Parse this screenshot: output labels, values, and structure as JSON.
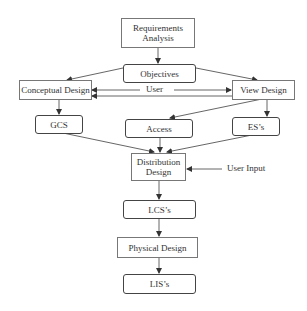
{
  "diagram": {
    "nodes": {
      "requirements_analysis": "Requirements\nAnalysis",
      "objectives": "Objectives",
      "conceptual_design": "Conceptual Design",
      "view_design": "View Design",
      "gcs": "GCS",
      "access": "Access",
      "ess": "ES’s",
      "distribution_design": "Distribution\nDesign",
      "lcss": "LCS’s",
      "physical_design": "Physical Design",
      "liss": "LIS’s"
    },
    "labels": {
      "user": "User",
      "user_input": "User Input"
    },
    "edges": [
      [
        "requirements_analysis",
        "objectives"
      ],
      [
        "objectives",
        "conceptual_design"
      ],
      [
        "objectives",
        "view_design"
      ],
      [
        "conceptual_design",
        "view_design"
      ],
      [
        "view_design",
        "conceptual_design"
      ],
      [
        "conceptual_design",
        "gcs"
      ],
      [
        "view_design",
        "access"
      ],
      [
        "view_design",
        "ess"
      ],
      [
        "gcs",
        "distribution_design"
      ],
      [
        "access",
        "distribution_design"
      ],
      [
        "ess",
        "distribution_design"
      ],
      [
        "user_input",
        "distribution_design"
      ],
      [
        "distribution_design",
        "lcss"
      ],
      [
        "lcss",
        "physical_design"
      ],
      [
        "physical_design",
        "liss"
      ]
    ]
  },
  "colors": {
    "line": "#444444",
    "box_border": "#777777",
    "text": "#333333"
  }
}
